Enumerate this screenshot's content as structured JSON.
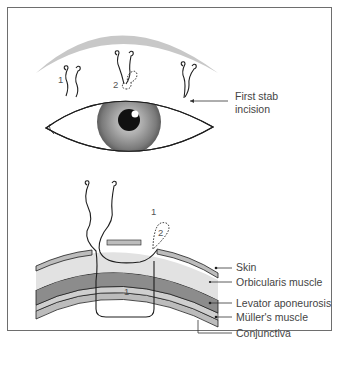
{
  "figure": {
    "top_panel": {
      "callout": {
        "line1": "First stab",
        "line2": "incision"
      },
      "suture_numbers": [
        "1",
        "2"
      ]
    },
    "bottom_panel": {
      "layer_labels": [
        {
          "label": "Skin"
        },
        {
          "label": "Orbicularis muscle"
        },
        {
          "label": "Levator aponeurosis"
        },
        {
          "label": "Müller's muscle"
        },
        {
          "label": "Conjunctiva"
        }
      ],
      "suture_numbers": {
        "top": "1",
        "loop": "2",
        "bite": "1"
      }
    },
    "colors": {
      "brow": "#c8c8c8",
      "skin": "#bdbdbd",
      "orbicularis": "#e2e2e2",
      "levator": "#8c8c8c",
      "muller": "#cfcfcf",
      "conjunctiva": "#bcbcbc",
      "line": "#1e1e1e"
    }
  }
}
